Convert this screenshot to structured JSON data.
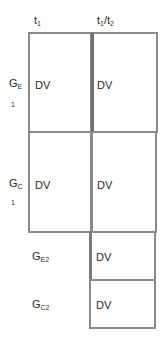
{
  "columns": {
    "col1": {
      "base": "t",
      "sub": "1"
    },
    "col2": {
      "base": "t",
      "sub": "1",
      "sep": "/",
      "base2": "t",
      "sub2": "2"
    }
  },
  "rows": [
    {
      "label_base": "G",
      "label_sub": "E",
      "index": "1",
      "cells": [
        "DV",
        "DV"
      ]
    },
    {
      "label_base": "G",
      "label_sub": "C",
      "index": "1",
      "cells": [
        "DV",
        "DV"
      ]
    },
    {
      "label_base": "G",
      "label_sub": "E2",
      "cells": [
        "DV"
      ]
    },
    {
      "label_base": "G",
      "label_sub": "C2",
      "cells": [
        "DV"
      ]
    }
  ],
  "colors": {
    "border": "#8a8a8a",
    "divider": "#6e6e6e",
    "text": "#2a2a2a"
  }
}
